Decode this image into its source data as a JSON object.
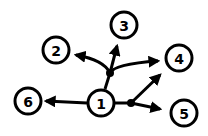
{
  "diagram": {
    "type": "hypergraph",
    "nodes": [
      {
        "id": "1",
        "label": "1",
        "x": 101,
        "y": 103
      },
      {
        "id": "2",
        "label": "2",
        "x": 56,
        "y": 50
      },
      {
        "id": "3",
        "label": "3",
        "x": 124,
        "y": 25
      },
      {
        "id": "4",
        "label": "4",
        "x": 179,
        "y": 58
      },
      {
        "id": "5",
        "label": "5",
        "x": 184,
        "y": 113
      },
      {
        "id": "6",
        "label": "6",
        "x": 28,
        "y": 101
      }
    ],
    "edges": [
      {
        "from": "1",
        "to": [
          "6"
        ]
      },
      {
        "from": "1",
        "to": [
          "2",
          "3",
          "4"
        ]
      },
      {
        "from": "1",
        "to": [
          "4",
          "5"
        ]
      }
    ],
    "colors": {
      "stroke": "#000000",
      "fill": "#ffffff"
    }
  }
}
